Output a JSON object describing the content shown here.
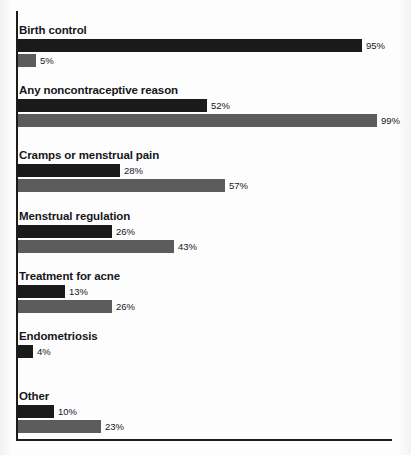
{
  "chart_data": {
    "type": "bar",
    "orientation": "horizontal",
    "title": "",
    "subtitle": "",
    "xlabel": "",
    "ylabel": "",
    "xlim": [
      0,
      100
    ],
    "grid": false,
    "legend": "none",
    "value_suffix": "%",
    "categories": [
      "Birth control",
      "Any noncontraceptive reason",
      "Cramps or menstrual pain",
      "Menstrual regulation",
      "Treatment for acne",
      "Endometriosis",
      "Other"
    ],
    "series": [
      {
        "name": "series-1",
        "color": "#1a1a1a",
        "values": [
          95,
          52,
          28,
          26,
          13,
          4,
          10
        ],
        "labels": [
          "95%",
          "52%",
          "28%",
          "26%",
          "13%",
          "4%",
          "10%"
        ]
      },
      {
        "name": "series-2",
        "color": "#5c5c5c",
        "values": [
          5,
          99,
          57,
          43,
          26,
          null,
          23
        ],
        "labels": [
          "5%",
          "99%",
          "57%",
          "43%",
          "26%",
          null,
          "23%"
        ]
      }
    ]
  },
  "colors": {
    "series_1": "#1a1a1a",
    "series_2": "#5c5c5c",
    "axis": "#1c1c1c",
    "background": "#fdfdfd",
    "text": "#17171a"
  }
}
